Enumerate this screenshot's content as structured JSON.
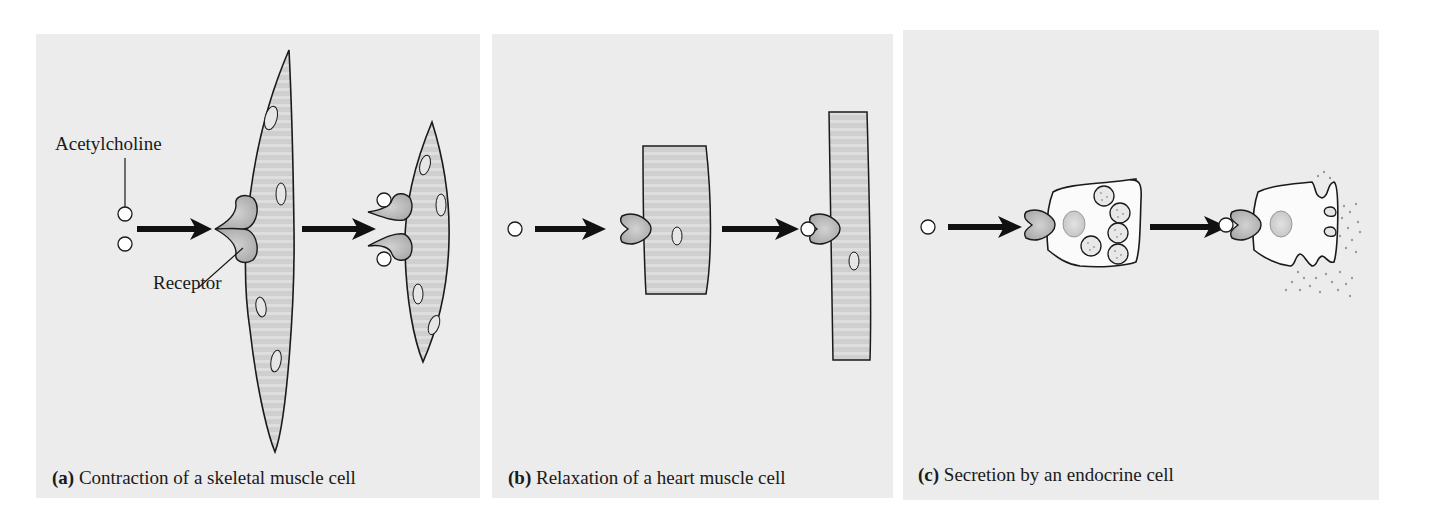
{
  "figure": {
    "panels": [
      {
        "id": "a",
        "letter": "(a)",
        "caption": "Contraction of a skeletal muscle cell",
        "labels": {
          "signal": "Acetylcholine",
          "receptor": "Receptor"
        }
      },
      {
        "id": "b",
        "letter": "(b)",
        "caption": "Relaxation of a heart muscle cell"
      },
      {
        "id": "c",
        "letter": "(c)",
        "caption": "Secretion by an endocrine cell"
      }
    ],
    "colors": {
      "panel_bg": "#ececec",
      "cell_fill": "#c8c8c8",
      "stripe": "#dadada",
      "receptor_fill": "#b8b8b8",
      "outline": "#1a1a1a",
      "white": "#ffffff"
    }
  }
}
